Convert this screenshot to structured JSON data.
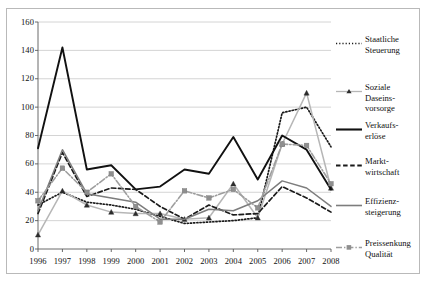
{
  "chart_data": {
    "type": "line",
    "title": "",
    "xlabel": "",
    "ylabel": "",
    "categories": [
      "1996",
      "1997",
      "1998",
      "1999",
      "2000",
      "2001",
      "2002",
      "2003",
      "2004",
      "2005",
      "2006",
      "2007",
      "2008"
    ],
    "ylim": [
      0,
      160
    ],
    "ytick_step": 20,
    "yticks": [
      "0",
      "20",
      "40",
      "60",
      "80",
      "100",
      "120",
      "140",
      "160"
    ],
    "grid": "horizontal",
    "legend_position": "right",
    "series": [
      {
        "name": "Staatliche\nSteuerung",
        "style": "dotted",
        "color": "#1a1a1a",
        "marker": "none",
        "values": [
          31,
          40,
          33,
          31,
          28,
          23,
          18,
          19,
          20,
          22,
          96,
          100,
          72
        ]
      },
      {
        "name": "Soziale\nDaseinsvorsorge",
        "style": "solid",
        "color": "#b6b6b6",
        "marker": "triangle",
        "values": [
          10,
          41,
          31,
          26,
          25,
          25,
          21,
          22,
          46,
          22,
          74,
          110,
          43
        ]
      },
      {
        "name": "Verkaufs-\nerlöse",
        "style": "solid",
        "color": "#111111",
        "marker": "none",
        "values": [
          71,
          142,
          56,
          59,
          42,
          44,
          56,
          53,
          79,
          49,
          80,
          70,
          42
        ]
      },
      {
        "name": "Markt-\nwirtschaft",
        "style": "dashed",
        "color": "#1a1a1a",
        "marker": "none",
        "values": [
          25,
          68,
          37,
          43,
          42,
          30,
          21,
          31,
          24,
          25,
          44,
          36,
          26
        ]
      },
      {
        "name": "Effizienz-\nsteigerung",
        "style": "solid",
        "color": "#7d7d7d",
        "marker": "none",
        "values": [
          27,
          70,
          39,
          36,
          33,
          21,
          21,
          28,
          27,
          34,
          48,
          43,
          30
        ]
      },
      {
        "name": "Preissenkung\nQualität",
        "style": "dashdot",
        "color": "#9e9e9e",
        "marker": "square",
        "values": [
          34,
          57,
          40,
          53,
          30,
          19,
          41,
          36,
          42,
          29,
          74,
          73,
          46
        ]
      }
    ]
  },
  "legend": {
    "items": [
      {
        "label": "Staatliche\nSteuerung",
        "key": "dotted-key"
      },
      {
        "label": "Soziale\nDaseins-\nvorsorge",
        "key": "triangle-line-key"
      },
      {
        "label": "Verkaufs-\nerlöse",
        "key": "solid-thick-key"
      },
      {
        "label": "Markt-\nwirtschaft",
        "key": "dashed-key"
      },
      {
        "label": "Effizienz-\nsteigerung",
        "key": "solid-gray-key"
      },
      {
        "label": "Preissenkung\nQualität",
        "key": "square-dashdot-key"
      }
    ]
  }
}
